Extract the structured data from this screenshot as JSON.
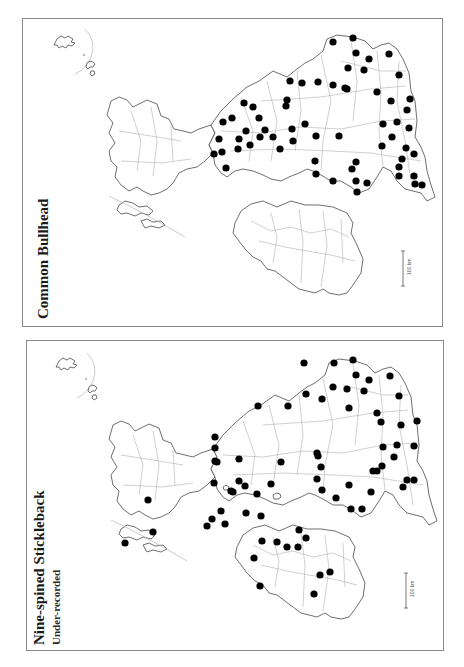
{
  "panels": [
    {
      "id": "common-bullhead",
      "title": "Common Bullhead",
      "subtitle": "",
      "scale_label": "100 km",
      "dots": [
        [
          332,
          41
        ],
        [
          352,
          37
        ],
        [
          355,
          52
        ],
        [
          368,
          58
        ],
        [
          388,
          53
        ],
        [
          347,
          67
        ],
        [
          363,
          69
        ],
        [
          398,
          74
        ],
        [
          376,
          91
        ],
        [
          346,
          88
        ],
        [
          409,
          98
        ],
        [
          390,
          100
        ],
        [
          406,
          109
        ],
        [
          396,
          121
        ],
        [
          382,
          123
        ],
        [
          408,
          127
        ],
        [
          391,
          136
        ],
        [
          381,
          145
        ],
        [
          405,
          147
        ],
        [
          413,
          153
        ],
        [
          401,
          158
        ],
        [
          398,
          166
        ],
        [
          398,
          175
        ],
        [
          413,
          175
        ],
        [
          421,
          184
        ],
        [
          414,
          183
        ],
        [
          366,
          182
        ],
        [
          355,
          161
        ],
        [
          351,
          168
        ],
        [
          356,
          191
        ],
        [
          355,
          180
        ],
        [
          332,
          180
        ],
        [
          315,
          173
        ],
        [
          314,
          160
        ],
        [
          338,
          135
        ],
        [
          315,
          135
        ],
        [
          289,
          80
        ],
        [
          301,
          82
        ],
        [
          317,
          81
        ],
        [
          332,
          84
        ],
        [
          344,
          87
        ],
        [
          286,
          99
        ],
        [
          252,
          106
        ],
        [
          285,
          105
        ],
        [
          264,
          129
        ],
        [
          258,
          117
        ],
        [
          222,
          121
        ],
        [
          231,
          117
        ],
        [
          238,
          138
        ],
        [
          245,
          130
        ],
        [
          259,
          136
        ],
        [
          237,
          148
        ],
        [
          249,
          144
        ],
        [
          225,
          167
        ],
        [
          272,
          136
        ],
        [
          279,
          148
        ],
        [
          291,
          128
        ],
        [
          304,
          123
        ],
        [
          292,
          140
        ],
        [
          243,
          102
        ],
        [
          221,
          151
        ],
        [
          213,
          153
        ],
        [
          218,
          138
        ]
      ]
    },
    {
      "id": "nine-spined-stickleback",
      "title": "Nine-spined Stickleback",
      "subtitle": "Under-recorded",
      "scale_label": "100 km",
      "dots": [
        [
          333,
          362
        ],
        [
          352,
          359
        ],
        [
          355,
          374
        ],
        [
          368,
          379
        ],
        [
          389,
          375
        ],
        [
          346,
          388
        ],
        [
          363,
          390
        ],
        [
          398,
          395
        ],
        [
          376,
          412
        ],
        [
          348,
          407
        ],
        [
          380,
          421
        ],
        [
          416,
          420
        ],
        [
          400,
          424
        ],
        [
          396,
          444
        ],
        [
          382,
          446
        ],
        [
          413,
          445
        ],
        [
          393,
          456
        ],
        [
          381,
          465
        ],
        [
          406,
          479
        ],
        [
          413,
          479
        ],
        [
          402,
          486
        ],
        [
          376,
          470
        ],
        [
          372,
          470
        ],
        [
          370,
          491
        ],
        [
          350,
          508
        ],
        [
          361,
          508
        ],
        [
          348,
          484
        ],
        [
          335,
          497
        ],
        [
          321,
          489
        ],
        [
          317,
          455
        ],
        [
          320,
          466
        ],
        [
          316,
          478
        ],
        [
          316,
          452
        ],
        [
          303,
          362
        ],
        [
          287,
          405
        ],
        [
          321,
          398
        ],
        [
          332,
          386
        ],
        [
          257,
          405
        ],
        [
          270,
          483
        ],
        [
          256,
          493
        ],
        [
          220,
          510
        ],
        [
          214,
          460
        ],
        [
          230,
          490
        ],
        [
          238,
          480
        ],
        [
          244,
          485
        ],
        [
          238,
          458
        ],
        [
          213,
          482
        ],
        [
          280,
          461
        ],
        [
          305,
          393
        ],
        [
          214,
          436
        ],
        [
          214,
          447
        ],
        [
          253,
          557
        ],
        [
          261,
          540
        ],
        [
          276,
          541
        ],
        [
          305,
          537
        ],
        [
          297,
          546
        ],
        [
          286,
          546
        ],
        [
          298,
          529
        ],
        [
          319,
          574
        ],
        [
          329,
          571
        ],
        [
          313,
          593
        ],
        [
          259,
          585
        ],
        [
          245,
          512
        ],
        [
          260,
          515
        ],
        [
          216,
          461
        ],
        [
          147,
          499
        ],
        [
          152,
          531
        ],
        [
          124,
          542
        ],
        [
          206,
          525
        ],
        [
          211,
          518
        ],
        [
          224,
          523
        ],
        [
          232,
          491
        ]
      ]
    }
  ],
  "colors": {
    "border": "#8a8a8a",
    "coast": "#4a4a4a",
    "internal_boundary": "#a8a8a8",
    "dot": "#000000"
  }
}
